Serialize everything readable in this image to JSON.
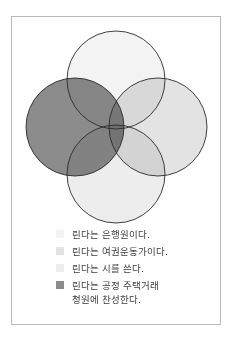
{
  "diagram": {
    "type": "venn",
    "sets": [
      {
        "id": "bank_teller",
        "label": "린다는 은행원이다.",
        "color": "#f3f3f3",
        "cx": 116,
        "cy": 80,
        "r": 49
      },
      {
        "id": "feminist",
        "label": "린다는 여권운동가이다.",
        "color": "#e3e3e3",
        "cx": 158,
        "cy": 127,
        "r": 49
      },
      {
        "id": "poet",
        "label": "린다는 시를 쓴다.",
        "color": "#ededed",
        "cx": 116,
        "cy": 174,
        "r": 49
      },
      {
        "id": "fair_housing",
        "label": "린다는 공정 주택거래 청원에 찬성한다.",
        "color": "#8c8c8c",
        "cx": 75,
        "cy": 127,
        "r": 49
      }
    ],
    "outline_color": "#2a2a2a"
  },
  "legend": {
    "items": [
      {
        "lines": [
          "린다는 은행원이다."
        ],
        "color": "#f3f3f3"
      },
      {
        "lines": [
          "린다는 여권운동가이다."
        ],
        "color": "#e3e3e3"
      },
      {
        "lines": [
          "린다는 시를 쓴다."
        ],
        "color": "#ededed"
      },
      {
        "lines": [
          "린다는 공정 주택거래",
          "청원에 찬성한다."
        ],
        "color": "#8c8c8c"
      }
    ]
  }
}
